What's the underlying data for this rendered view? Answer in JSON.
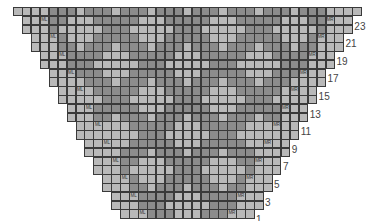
{
  "chart": {
    "type": "knitting-colorwork-chart",
    "total_columns": 39,
    "cell_width": 8.93,
    "cell_height": 8.8,
    "origin_x": 13,
    "origin_y": 7,
    "colors": {
      "light": "#b9b9b9",
      "dark": "#8c8c8c",
      "grid": "#3a3a3a"
    },
    "markers": {
      "left": "ML",
      "right": "MR"
    },
    "row_labels": [
      "23",
      "21",
      "19",
      "17",
      "15",
      "13",
      "11",
      "9",
      "7",
      "5",
      "3",
      "1"
    ],
    "rows": [
      {
        "number": 24,
        "offset": 0,
        "cells": "DDDLDDDLDDDLDDDLDDDLDDDLDDDLDDDLDDDLDDD"
      },
      {
        "number": 23,
        "offset": 1,
        "cells": "LDDDDDLLLDDDDDLLLDDDDDLLLDDDDDLLLDDDDDL",
        "label": "23",
        "markers": true
      },
      {
        "number": 22,
        "offset": 1,
        "cells": "LLDDDLLLLLDDDLLLLLDDDLLLLLDDDLLLLLDDDLL"
      },
      {
        "number": 21,
        "offset": 2,
        "cells": "LDDDDDLLLDDDDDLLLDDDDDLLLDDDDDLLLDDDDDL",
        "label": "21",
        "markers": true
      },
      {
        "number": 20,
        "offset": 2,
        "cells": "DDDLDDDLDDDLDDDLDDDLDDDLDDDLDDDLDDDLDDD"
      },
      {
        "number": 19,
        "offset": 3,
        "cells": "DDLLLDDDDDLLLDDDDDLLLDDDDDLLLDDDDDLLLDD",
        "label": "19",
        "markers": true
      },
      {
        "number": 18,
        "offset": 3,
        "cells": "DLLLLLDDDLLLLLDDDLLLLLDDDLLLLLDDDLLLLLD"
      },
      {
        "number": 17,
        "offset": 4,
        "cells": "DDLLLDDDDDLLLDDDDDLLLDDDDDLLLDDDDDLLLDD",
        "label": "17",
        "markers": true
      },
      {
        "number": 16,
        "offset": 4,
        "cells": "DDDLDDDLDDDLDDDLDDDLDDDLDDDLDDDLDDDLDDD"
      },
      {
        "number": 15,
        "offset": 5,
        "cells": "LDDDDDLLLDDDDDLLLDDDDDLLLDDDDDLLLDDDDDL",
        "label": "15",
        "markers": true
      },
      {
        "number": 14,
        "offset": 5,
        "cells": "LLDDDLLLLLDDDLLLLLDDDLLLLLDDDLLLLLDDDLL"
      },
      {
        "number": 13,
        "offset": 6,
        "cells": "LDDDDDLLLDDDDDLLLDDDDDLLLDDDDDLLLDDDDDL",
        "label": "13",
        "markers": true
      },
      {
        "number": 12,
        "offset": 6,
        "cells": "DDDLDDDLDDDLDDDLDDDLDDDLDDDLDDDLDDDLDDD"
      },
      {
        "number": 11,
        "offset": 7,
        "cells": "DDLLLDDDDDLLLDDDDDLLLDDDDDLLLDDDDDLLLDD",
        "label": "11",
        "markers": true
      },
      {
        "number": 10,
        "offset": 7,
        "cells": "DLLLLLDDDLLLLLDDDLLLLLDDDLLLLLDDDLLLLLD"
      },
      {
        "number": 9,
        "offset": 8,
        "cells": "DDLLLDDDDDLLLDDDDDLLLDDDDDLLLDDDDDLLLDD",
        "label": "9",
        "markers": true
      },
      {
        "number": 8,
        "offset": 8,
        "cells": "DDDLDDDLDDDLDDDLDDDLDDDLDDDLDDDLDDDLDDD"
      },
      {
        "number": 7,
        "offset": 9,
        "cells": "LDDDDDLLLDDDDDLLLDDDDDLLLDDDDDLLLDDDDDL",
        "label": "7",
        "markers": true
      },
      {
        "number": 6,
        "offset": 9,
        "cells": "LLDDDLLLLLDDDLLLLLDDDLLLLLDDDLLLLLDDDLL"
      },
      {
        "number": 5,
        "offset": 10,
        "cells": "LDDDDDLLLDDDDDLLLDDDDDLLLDDDDDLLLDDDDDL",
        "label": "5",
        "markers": true
      },
      {
        "number": 4,
        "offset": 10,
        "cells": "DDDLDDDLDDDLDDDLDDDLDDDLDDDLDDDLDDDLDDD"
      },
      {
        "number": 3,
        "offset": 11,
        "cells": "DDLLLDDDDDLLLDDDDDLLLDDDDDLLLDDDDDLLLDD",
        "label": "3",
        "markers": true
      },
      {
        "number": 2,
        "offset": 11,
        "cells": "DLLLLLDDDLLLLLDDDLLLLLDDDLLLLLDDDLLLLLD"
      },
      {
        "number": 1,
        "offset": 12,
        "cells": "DDLLLDDDDDLLLDDDDDLLLDDDDDLLLDDDDDLLLDD",
        "label": "1",
        "markers": true
      }
    ]
  }
}
